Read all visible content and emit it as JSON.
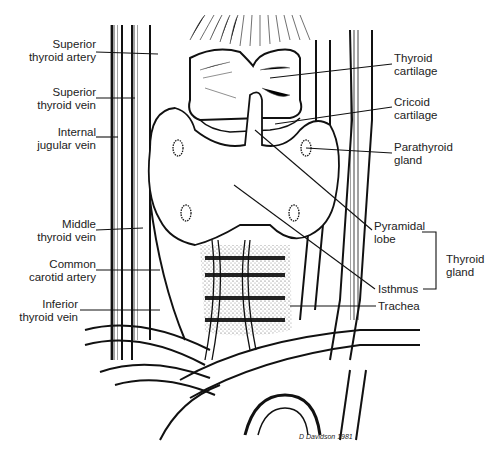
{
  "diagram": {
    "colors": {
      "ink": "#111111",
      "paper": "#ffffff",
      "stipple": "#9a9a9a"
    },
    "labels_left": [
      {
        "id": "superior-thyroid-artery",
        "line1": "Superior",
        "line2": "thyroid artery"
      },
      {
        "id": "superior-thyroid-vein",
        "line1": "Superior",
        "line2": "thyroid vein"
      },
      {
        "id": "internal-jugular-vein",
        "line1": "Internal",
        "line2": "jugular vein"
      },
      {
        "id": "middle-thyroid-vein",
        "line1": "Middle",
        "line2": "thyroid vein"
      },
      {
        "id": "common-carotid-artery",
        "line1": "Common",
        "line2": "carotid artery"
      },
      {
        "id": "inferior-thyroid-vein",
        "line1": "Inferior",
        "line2": "thyroid vein"
      }
    ],
    "labels_right": [
      {
        "id": "thyroid-cartilage",
        "line1": "Thyroid",
        "line2": "cartilage"
      },
      {
        "id": "cricoid-cartilage",
        "line1": "Cricoid",
        "line2": "cartilage"
      },
      {
        "id": "parathyroid-gland",
        "line1": "Parathyroid",
        "line2": "gland"
      },
      {
        "id": "pyramidal-lobe",
        "line1": "Pyramidal",
        "line2": "lobe"
      },
      {
        "id": "isthmus",
        "line1": "Isthmus",
        "line2": ""
      },
      {
        "id": "trachea",
        "line1": "Trachea",
        "line2": ""
      }
    ],
    "bracket_label": {
      "line1": "Thyroid",
      "line2": "gland"
    },
    "signature": "D Davidson 1981"
  }
}
